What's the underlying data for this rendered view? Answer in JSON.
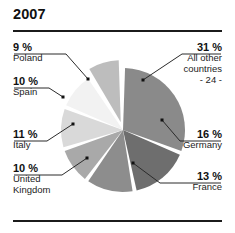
{
  "chart_title": "2007",
  "chart_data": {
    "type": "pie",
    "title": "2007",
    "xlabel": "",
    "ylabel": "",
    "legend_position": "callout-labels",
    "grid": false,
    "value_suffix": "%",
    "categories": [
      "All other countries",
      "Germany",
      "France",
      "United Kingdom",
      "Italy",
      "Spain",
      "Poland"
    ],
    "values": [
      31,
      16,
      13,
      10,
      11,
      10,
      9
    ],
    "slices": [
      {
        "label": "All other countries",
        "sublabel": "- 24 -",
        "percent": 31,
        "percent_text": "31 %",
        "color": "#8a8a8a",
        "side": "right"
      },
      {
        "label": "Germany",
        "sublabel": "",
        "percent": 16,
        "percent_text": "16 %",
        "color": "#6e6e6e",
        "side": "right"
      },
      {
        "label": "France",
        "sublabel": "",
        "percent": 13,
        "percent_text": "13 %",
        "color": "#8d8d8d",
        "side": "right"
      },
      {
        "label": "United Kingdom",
        "sublabel": "",
        "percent": 10,
        "percent_text": "10 %",
        "color": "#a9a9a9",
        "side": "left"
      },
      {
        "label": "Italy",
        "sublabel": "",
        "percent": 11,
        "percent_text": "11 %",
        "color": "#d9d9d9",
        "side": "left"
      },
      {
        "label": "Spain",
        "sublabel": "",
        "percent": 10,
        "percent_text": "10 %",
        "color": "#f2f2f2",
        "side": "left"
      },
      {
        "label": "Poland",
        "sublabel": "",
        "percent": 9,
        "percent_text": "9 %",
        "color": "#bdbdbd",
        "side": "left"
      }
    ]
  },
  "callouts": {
    "poland": {
      "percent": "9 %",
      "name": "Poland"
    },
    "spain": {
      "percent": "10 %",
      "name": "Spain"
    },
    "italy": {
      "percent": "11 %",
      "name": "Italy"
    },
    "uk": {
      "percent": "10 %",
      "name_line1": "United",
      "name_line2": "Kingdom"
    },
    "other": {
      "percent": "31 %",
      "name_line1": "All other",
      "name_line2": "countries",
      "name_line3": "- 24 -"
    },
    "germany": {
      "percent": "16 %",
      "name": "Germany"
    },
    "france": {
      "percent": "13 %",
      "name": "France"
    }
  },
  "colors": {
    "rule": "#1b1b1b",
    "text": "#111111",
    "leader_line": "#2b2b2b",
    "background": "#ffffff"
  }
}
